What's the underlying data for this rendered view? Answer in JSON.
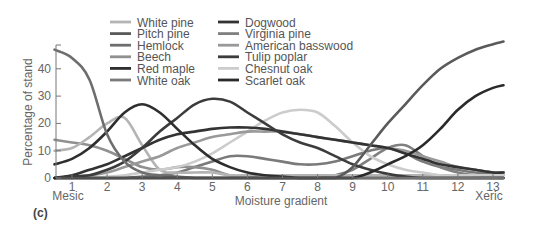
{
  "chart_data": {
    "type": "line",
    "title": "",
    "panel_label": "(c)",
    "xlabel": "Moisture gradient",
    "ylabel": "Percentage of stand",
    "x_end_labels": {
      "left": "Mesic",
      "right": "Xeric"
    },
    "xticks": [
      1,
      2,
      3,
      4,
      5,
      6,
      7,
      8,
      9,
      10,
      11,
      12,
      13
    ],
    "yticks": [
      0,
      10,
      20,
      30,
      40
    ],
    "xlim": [
      0.5,
      13.3
    ],
    "ylim": [
      0,
      48
    ],
    "grid": false,
    "legend_position": "top-center",
    "x": [
      0.5,
      1,
      1.5,
      2,
      2.5,
      3,
      3.5,
      4,
      4.5,
      5,
      5.5,
      6,
      6.5,
      7,
      7.5,
      8,
      8.5,
      9,
      9.5,
      10,
      10.5,
      11,
      11.5,
      12,
      12.5,
      13,
      13.3
    ],
    "series": [
      {
        "name": "White pine",
        "color": "#b4b4b4",
        "values": [
          10,
          11,
          15,
          20,
          22,
          12,
          3,
          2,
          2,
          2,
          1,
          1,
          1,
          1,
          1,
          1,
          1,
          1,
          1,
          1,
          1,
          1,
          1,
          1,
          1,
          1,
          1
        ]
      },
      {
        "name": "Pitch pine",
        "color": "#5a5a5a",
        "values": [
          0,
          0,
          0,
          0,
          0,
          0,
          0,
          0,
          0,
          0,
          0,
          0,
          0,
          0,
          0,
          0,
          0,
          4,
          12,
          20,
          27,
          34,
          40,
          44,
          47,
          49,
          50
        ]
      },
      {
        "name": "Hemlock",
        "color": "#6e6e6e",
        "values": [
          47,
          44,
          36,
          16,
          6,
          2,
          1,
          0.5,
          0,
          0,
          0,
          0,
          0,
          0,
          0,
          0,
          0,
          0,
          0,
          0,
          0,
          0,
          0,
          0,
          0,
          0,
          0
        ]
      },
      {
        "name": "Beech",
        "color": "#909090",
        "values": [
          14,
          13,
          12,
          10,
          7,
          4,
          3,
          4,
          4,
          3,
          1,
          0.5,
          0,
          0,
          0,
          0,
          0,
          0,
          0,
          0,
          0,
          0,
          0,
          0,
          0,
          0,
          0
        ]
      },
      {
        "name": "Red maple",
        "color": "#2e2e2e",
        "values": [
          5,
          7,
          11,
          17,
          24,
          27,
          24,
          18,
          12,
          7,
          4,
          2,
          1,
          0.5,
          0,
          0,
          0,
          0,
          0,
          0,
          0,
          0,
          0,
          0,
          0,
          0,
          0
        ]
      },
      {
        "name": "White oak",
        "color": "#7a7a7a",
        "values": [
          0,
          0,
          0,
          0,
          0,
          0.5,
          1,
          2,
          4,
          6,
          8,
          8,
          7,
          6,
          5,
          5,
          6,
          8,
          10,
          11,
          9,
          6,
          4,
          3,
          2,
          2,
          2
        ]
      },
      {
        "name": "Dogwood",
        "color": "#333333",
        "values": [
          0,
          1,
          3,
          5,
          8,
          11,
          14,
          16,
          17,
          18,
          18.5,
          18.5,
          18,
          17,
          16,
          15,
          14,
          13,
          12,
          11,
          9,
          7,
          5,
          4,
          3,
          2,
          2
        ]
      },
      {
        "name": "Virginia pine",
        "color": "#808080",
        "values": [
          0,
          0,
          0,
          0,
          0,
          0,
          0,
          0,
          0,
          0,
          0,
          0,
          0,
          0,
          0,
          0,
          1,
          3,
          7,
          11,
          12,
          8,
          4,
          2,
          1,
          1,
          1
        ]
      },
      {
        "name": "American basswood",
        "color": "#999999",
        "values": [
          0,
          0.5,
          1,
          2,
          4,
          6,
          8,
          11,
          13,
          15,
          16,
          17,
          17,
          17,
          16,
          15,
          14,
          13,
          12,
          11,
          10,
          8,
          6,
          4,
          3,
          2,
          2
        ]
      },
      {
        "name": "Tulip poplar",
        "color": "#3c3c3c",
        "values": [
          0,
          0.5,
          1,
          3,
          6,
          11,
          17,
          22,
          27,
          29,
          28,
          24,
          20,
          16,
          13,
          11,
          8,
          5,
          3,
          1.5,
          0.5,
          0,
          0,
          0,
          0,
          0,
          0
        ]
      },
      {
        "name": "Chesnut oak",
        "color": "#cccccc",
        "values": [
          0,
          0,
          0,
          0.5,
          1,
          2,
          3,
          4,
          6,
          9,
          13,
          17,
          21,
          24,
          25,
          24,
          19,
          13,
          8,
          5,
          3,
          2,
          1,
          1,
          1,
          1,
          1
        ]
      },
      {
        "name": "Scarlet oak",
        "color": "#2a2a2a",
        "values": [
          0,
          0,
          0,
          0,
          0,
          0,
          0,
          0,
          0,
          0,
          0,
          0,
          0,
          0,
          0,
          0,
          0,
          0,
          2,
          5,
          8,
          12,
          18,
          25,
          30,
          33,
          34
        ]
      }
    ]
  },
  "legend": {
    "left": [
      "White pine",
      "Pitch pine",
      "Hemlock",
      "Beech",
      "Red maple",
      "White oak"
    ],
    "right": [
      "Dogwood",
      "Virginia pine",
      "American basswood",
      "Tulip poplar",
      "Chesnut oak",
      "Scarlet oak"
    ]
  },
  "axis": {
    "ylabel": "Percentage of stand",
    "xlabel": "Moisture gradient",
    "left_end": "Mesic",
    "right_end": "Xeric",
    "panel": "(c)"
  }
}
